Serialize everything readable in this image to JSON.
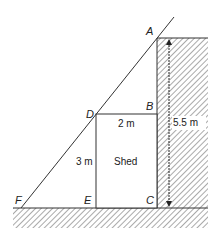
{
  "diagram": {
    "points": {
      "A": "A",
      "B": "B",
      "C": "C",
      "D": "D",
      "E": "E",
      "F": "F"
    },
    "labels": {
      "shed": "Shed",
      "shed_width": "2 m",
      "shed_height": "3 m",
      "wall_height": "5.5 m"
    },
    "colors": {
      "line": "#333333",
      "hatch": "#555555",
      "background": "#ffffff"
    }
  }
}
